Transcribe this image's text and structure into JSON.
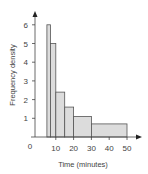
{
  "chart_data": {
    "type": "bar",
    "subtype": "histogram",
    "title": "",
    "xlabel": "Time (minutes)",
    "ylabel": "Frequency density",
    "origin_label": "0",
    "x_ticks": [
      10,
      20,
      30,
      40,
      50
    ],
    "y_ticks": [
      1,
      2,
      3,
      4,
      5,
      6
    ],
    "xlim": [
      0,
      50
    ],
    "ylim": [
      0,
      6
    ],
    "grid": false,
    "legend": null,
    "bins": [
      {
        "x0": 5,
        "x1": 7,
        "value": 6
      },
      {
        "x0": 7,
        "x1": 10,
        "value": 5
      },
      {
        "x0": 10,
        "x1": 15,
        "value": 2.4
      },
      {
        "x0": 15,
        "x1": 20,
        "value": 1.6
      },
      {
        "x0": 20,
        "x1": 30,
        "value": 1.1
      },
      {
        "x0": 30,
        "x1": 50,
        "value": 0.7
      }
    ],
    "colors": {
      "bar_fill": "#dcdcdc",
      "bar_stroke": "#555555",
      "axis": "#444444"
    }
  }
}
